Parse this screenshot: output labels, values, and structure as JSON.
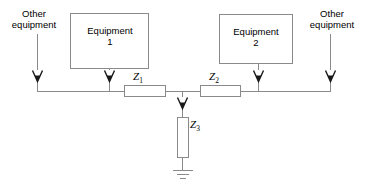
{
  "diagram": {
    "stroke_color": "#7f7f7f",
    "text_color": "#000000",
    "background": "#ffffff",
    "labels": {
      "other_equipment_left_line1": "Other",
      "other_equipment_left_line2": "equipment",
      "other_equipment_right_line1": "Other",
      "other_equipment_right_line2": "equipment",
      "equipment_1_line1": "Equipment",
      "equipment_1_line2": "1",
      "equipment_2_line1": "Equipment",
      "equipment_2_line2": "2",
      "z1": "Z",
      "z1_sub": "1",
      "z2": "Z",
      "z2_sub": "2",
      "z3": "Z",
      "z3_sub": "3"
    }
  }
}
